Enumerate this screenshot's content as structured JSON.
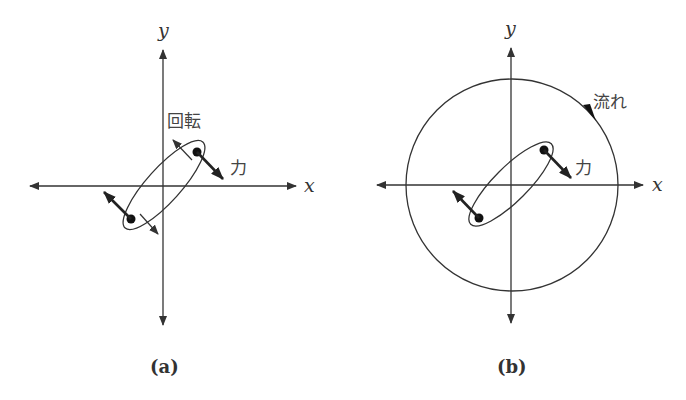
{
  "figure": {
    "panel_a": {
      "caption": "(a)",
      "x_axis_label": "x",
      "y_axis_label": "y",
      "rotation_label": "回転",
      "force_label": "力"
    },
    "panel_b": {
      "caption": "(b)",
      "x_axis_label": "x",
      "y_axis_label": "y",
      "flow_label": "流れ",
      "force_label": "力"
    },
    "colors": {
      "line": "#333333",
      "background": "#ffffff"
    }
  }
}
